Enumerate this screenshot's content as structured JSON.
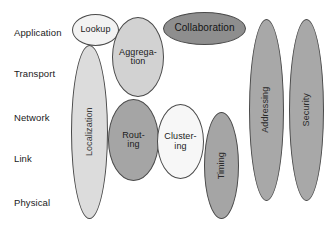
{
  "diagram": {
    "type": "layered-stack-ellipse-diagram",
    "width": 331,
    "height": 231,
    "background_color": "#ffffff"
  },
  "layers": [
    {
      "id": "application",
      "label": "Application",
      "x": 14,
      "y": 28
    },
    {
      "id": "transport",
      "label": "Transport",
      "x": 14,
      "y": 69
    },
    {
      "id": "network",
      "label": "Network",
      "x": 14,
      "y": 113
    },
    {
      "id": "link",
      "label": "Link",
      "x": 14,
      "y": 154
    },
    {
      "id": "physical",
      "label": "Physical",
      "x": 14,
      "y": 198
    }
  ],
  "ellipses": [
    {
      "id": "lookup",
      "label": "Lookup",
      "orientation": "horizontal",
      "x": 72,
      "y": 14,
      "w": 47,
      "h": 32,
      "fill": "#f2f2f2",
      "stroke": "#4a4a4a",
      "text_color": "#1b1b1b",
      "font_size": 9
    },
    {
      "id": "aggregation",
      "label": "Aggrega-\ntion",
      "orientation": "horizontal",
      "x": 112,
      "y": 17,
      "w": 52,
      "h": 80,
      "fill": "#d2d2d2",
      "stroke": "#4a4a4a",
      "text_color": "#1b1b1b",
      "font_size": 9
    },
    {
      "id": "collaboration",
      "label": "Collaboration",
      "orientation": "horizontal",
      "x": 163,
      "y": 12,
      "w": 83,
      "h": 33,
      "fill": "#8e8e8e",
      "stroke": "#4a4a4a",
      "text_color": "#141414",
      "font_size": 10
    },
    {
      "id": "localization",
      "label": "Localization",
      "orientation": "vertical",
      "x": 71,
      "y": 45,
      "w": 37,
      "h": 174,
      "fill": "#dcdcdc",
      "stroke": "#4a4a4a",
      "text_color": "#3a3a3a",
      "font_size": 9
    },
    {
      "id": "routing",
      "label": "Rout-\ning",
      "orientation": "horizontal",
      "x": 108,
      "y": 99,
      "w": 51,
      "h": 82,
      "fill": "#a5a5a5",
      "stroke": "#4a4a4a",
      "text_color": "#1b1b1b",
      "font_size": 9
    },
    {
      "id": "clustering",
      "label": "Cluster-\ning",
      "orientation": "horizontal",
      "x": 157,
      "y": 104,
      "w": 47,
      "h": 75,
      "fill": "#f7f7f7",
      "stroke": "#4a4a4a",
      "text_color": "#1b1b1b",
      "font_size": 9
    },
    {
      "id": "timing",
      "label": "Timing",
      "orientation": "vertical",
      "x": 204,
      "y": 112,
      "w": 35,
      "h": 107,
      "fill": "#a5a5a5",
      "stroke": "#4a4a4a",
      "text_color": "#2a2a2a",
      "font_size": 9
    },
    {
      "id": "addressing",
      "label": "Addressing",
      "orientation": "vertical",
      "x": 249,
      "y": 19,
      "w": 35,
      "h": 182,
      "fill": "#a8a8a8",
      "stroke": "#4a4a4a",
      "text_color": "#2a2a2a",
      "font_size": 9
    },
    {
      "id": "security",
      "label": "Security",
      "orientation": "vertical",
      "x": 289,
      "y": 19,
      "w": 35,
      "h": 182,
      "fill": "#a8a8a8",
      "stroke": "#4a4a4a",
      "text_color": "#2a2a2a",
      "font_size": 9
    }
  ]
}
